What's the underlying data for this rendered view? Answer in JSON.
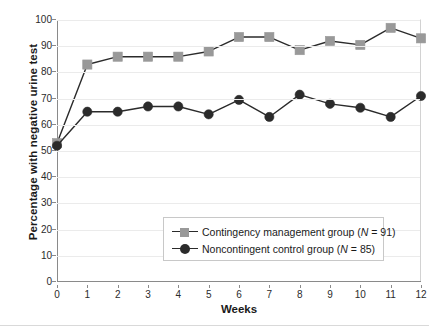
{
  "chart_data": {
    "type": "line",
    "title": "",
    "xlabel": "Weeks",
    "ylabel": "Percentage with negative urine test",
    "x": [
      0,
      1,
      2,
      3,
      4,
      5,
      6,
      7,
      8,
      9,
      10,
      11,
      12
    ],
    "categories": [
      "0",
      "1",
      "2",
      "3",
      "4",
      "5",
      "6",
      "7",
      "8",
      "9",
      "10",
      "11",
      "12"
    ],
    "xlim": [
      0,
      12
    ],
    "ylim": [
      0,
      100
    ],
    "yticks": [
      0,
      10,
      20,
      30,
      40,
      50,
      60,
      70,
      80,
      90,
      100
    ],
    "ytick_labels": [
      "0",
      "10",
      "20",
      "30",
      "40",
      "50",
      "60",
      "70",
      "80",
      "90",
      "100"
    ],
    "grid": "horizontal",
    "legend_position": "lower-center",
    "series": [
      {
        "name": "Contingency management group (N = 91)",
        "marker": "square",
        "color": "#999999",
        "line_color": "#2b2b2b",
        "values": [
          53,
          83,
          86,
          86,
          86,
          88,
          93.5,
          93.5,
          88.5,
          92,
          90.5,
          97,
          93
        ]
      },
      {
        "name": "Noncontingent control group (N = 85)",
        "marker": "circle",
        "color": "#2b2b2b",
        "line_color": "#2b2b2b",
        "values": [
          52,
          65,
          65,
          67,
          67,
          64,
          69.5,
          63,
          71.5,
          68,
          66.5,
          63,
          71
        ]
      }
    ]
  },
  "axes": {
    "ylabel": "Percentage with negative urine test",
    "xlabel": "Weeks"
  },
  "legend": {
    "entries": [
      {
        "label_prefix": "Contingency management group (",
        "label_italic": "N",
        "label_suffix": " = 91)",
        "marker": "square-marker",
        "color": "#999999"
      },
      {
        "label_prefix": "Noncontingent control group (",
        "label_italic": "N",
        "label_suffix": " = 85)",
        "marker": "circle-marker",
        "color": "#2b2b2b"
      }
    ]
  },
  "colors": {
    "series1": "#999999",
    "series2": "#2b2b2b",
    "line": "#2b2b2b",
    "grid": "#ebebeb",
    "axis": "#8a8a8a",
    "text": "#1a1a1a",
    "background": "#ffffff"
  }
}
